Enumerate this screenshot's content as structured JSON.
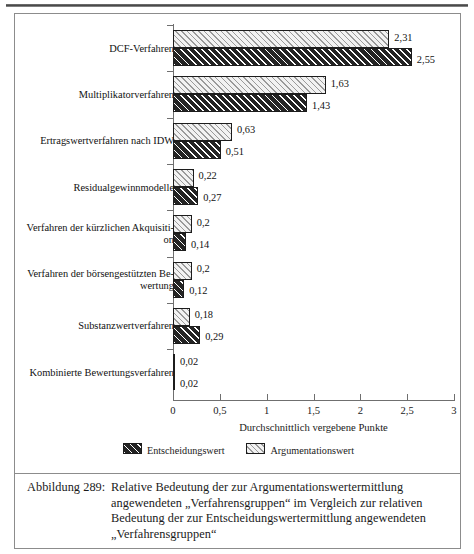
{
  "chart_data": {
    "type": "bar",
    "orientation": "horizontal",
    "title": "",
    "xlabel": "Durchschnittlich vergebene Punkte",
    "ylabel": "",
    "xlim": [
      0,
      3
    ],
    "xticks": [
      "0",
      "0,5",
      "1",
      "1,5",
      "2",
      "2,5",
      "3"
    ],
    "xtick_values": [
      0,
      0.5,
      1,
      1.5,
      2,
      2.5,
      3
    ],
    "grid": false,
    "legend_position": "bottom-center",
    "categories": [
      "DCF-Verfahren",
      "Multiplikatorverfahren",
      "Ertragswertverfahren nach IDW",
      "Residualgewinnmodelle",
      "Verfahren der kürzlichen Akquisiti-on",
      "Verfahren der börsengestützten Be-wertung",
      "Substanzwertverfahren",
      "Kombinierte Bewertungsverfahren"
    ],
    "category_lines": [
      [
        "DCF-Verfahren"
      ],
      [
        "Multiplikatorverfahren"
      ],
      [
        "Ertragswertverfahren nach IDW"
      ],
      [
        "Residualgewinnmodelle"
      ],
      [
        "Verfahren der kürzlichen Akquisiti-",
        "on"
      ],
      [
        "Verfahren der börsengestützten Be-",
        "wertung"
      ],
      [
        "Substanzwertverfahren"
      ],
      [
        "Kombinierte Bewertungsverfahren"
      ]
    ],
    "series": [
      {
        "name": "Argumentationswert",
        "style": "light-hatch",
        "values": [
          2.31,
          1.63,
          0.63,
          0.22,
          0.2,
          0.2,
          0.18,
          0.02
        ],
        "labels": [
          "2,31",
          "1,63",
          "0,63",
          "0,22",
          "0,2",
          "0,2",
          "0,18",
          "0,02"
        ]
      },
      {
        "name": "Entscheidungswert",
        "style": "dark-hatch",
        "values": [
          2.55,
          1.43,
          0.51,
          0.27,
          0.14,
          0.12,
          0.29,
          0.02
        ],
        "labels": [
          "2,55",
          "1,43",
          "0,51",
          "0,27",
          "0,14",
          "0,12",
          "0,29",
          "0,02"
        ]
      }
    ]
  },
  "legend": {
    "items": [
      {
        "label": "Entscheidungswert",
        "style": "dark"
      },
      {
        "label": "Argumentationswert",
        "style": "light"
      }
    ]
  },
  "caption": {
    "label": "Abbildung 289:",
    "lines": [
      "Relative Bedeutung der zur Argumentationswertermittlung",
      "angewendeten „Verfahrensgruppen“ im Vergleich zur relativen",
      "Bedeutung der zur Entscheidungswertermittlung angewendeten",
      "„Verfahrensgruppen“"
    ]
  },
  "colors": {
    "frame": "#8c8c8c",
    "axis": "#6f6f6f",
    "bar_dark": "#242424",
    "bar_light": "#f2f2f2",
    "text": "#111111"
  }
}
